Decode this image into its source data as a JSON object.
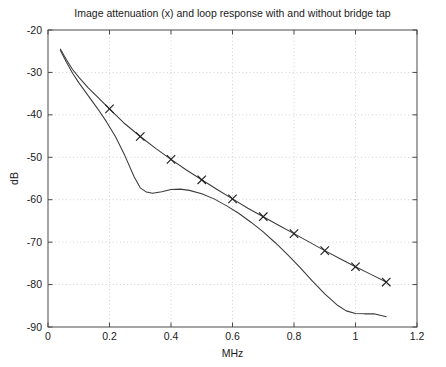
{
  "chart_data": {
    "type": "line",
    "title": "Image attenuation (x) and loop response with and without bridge tap",
    "xlabel": "MHz",
    "ylabel": "dB",
    "xlim": [
      0,
      1.2
    ],
    "ylim": [
      -90,
      -20
    ],
    "xticks": [
      0,
      0.2,
      0.4,
      0.6,
      0.8,
      1,
      1.2
    ],
    "xticklabels": [
      "0",
      "0.2",
      "0.4",
      "0.6",
      "0.8",
      "1",
      "1.2"
    ],
    "yticks": [
      -90,
      -80,
      -70,
      -60,
      -50,
      -40,
      -30,
      -20
    ],
    "yticklabels": [
      "-90",
      "-80",
      "-70",
      "-60",
      "-50",
      "-40",
      "-30",
      "-20"
    ],
    "grid": true,
    "grid_style": "dotted",
    "legend": null,
    "legend_position": "none",
    "marker_symbol": "x",
    "line_color": "#3a3a3a",
    "grid_color": "#c8c8bc",
    "axis_color": "#4a4a4a",
    "series": [
      {
        "name": "Image attenuation (x) / loop response without bridge tap",
        "marker": "x",
        "x": [
          0.04,
          0.06,
          0.08,
          0.1,
          0.13,
          0.16,
          0.2,
          0.25,
          0.3,
          0.35,
          0.4,
          0.45,
          0.5,
          0.55,
          0.6,
          0.65,
          0.7,
          0.75,
          0.8,
          0.85,
          0.9,
          0.95,
          1.0,
          1.05,
          1.1
        ],
        "y": [
          -24.5,
          -27.0,
          -29.3,
          -31.1,
          -33.6,
          -35.7,
          -38.6,
          -42.1,
          -45.1,
          -47.9,
          -50.5,
          -53.0,
          -55.3,
          -57.6,
          -59.8,
          -62.0,
          -64.0,
          -66.0,
          -68.0,
          -70.0,
          -72.0,
          -73.9,
          -75.8,
          -77.6,
          -79.4
        ],
        "marker_x": [
          0.2,
          0.3,
          0.4,
          0.5,
          0.6,
          0.7,
          0.8,
          0.9,
          1.0,
          1.1
        ],
        "marker_y": [
          -38.6,
          -45.1,
          -50.5,
          -55.3,
          -59.8,
          -64.0,
          -68.0,
          -72.0,
          -75.8,
          -79.4
        ]
      },
      {
        "name": "Loop response with bridge tap",
        "marker": "none",
        "x": [
          0.04,
          0.06,
          0.08,
          0.1,
          0.13,
          0.16,
          0.19,
          0.22,
          0.25,
          0.28,
          0.3,
          0.32,
          0.34,
          0.37,
          0.4,
          0.43,
          0.46,
          0.5,
          0.54,
          0.58,
          0.62,
          0.66,
          0.7,
          0.74,
          0.78,
          0.82,
          0.86,
          0.9,
          0.94,
          0.97,
          1.0,
          1.03,
          1.06,
          1.09,
          1.1
        ],
        "y": [
          -24.8,
          -27.6,
          -30.2,
          -32.4,
          -35.4,
          -38.4,
          -41.6,
          -45.2,
          -49.6,
          -54.6,
          -57.2,
          -58.2,
          -58.5,
          -58.1,
          -57.6,
          -57.5,
          -57.8,
          -58.6,
          -59.8,
          -61.4,
          -63.2,
          -65.3,
          -67.6,
          -70.2,
          -73.0,
          -76.0,
          -79.2,
          -82.2,
          -84.8,
          -86.2,
          -86.8,
          -86.9,
          -86.9,
          -87.4,
          -87.6
        ]
      }
    ]
  },
  "plot_geometry": {
    "left": 48,
    "top": 30,
    "right": 417,
    "bottom": 327
  },
  "figure": {
    "width": 446,
    "height": 367,
    "background": "#ffffff"
  }
}
